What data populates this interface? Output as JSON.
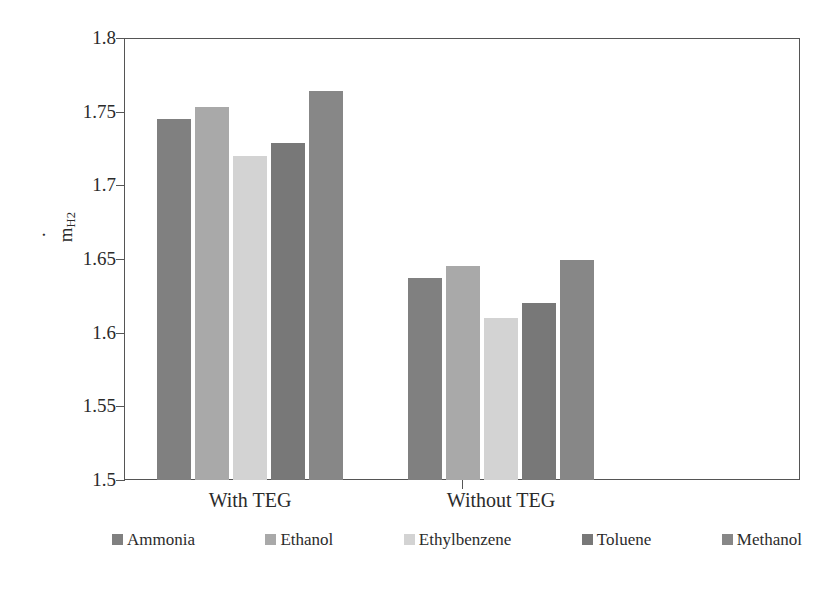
{
  "chart_data": {
    "type": "bar",
    "title": "",
    "subtitle": "",
    "xlabel": "",
    "ylabel": "mdot_H2",
    "ylabel_display": "ṁ",
    "ylabel_subscript": "H2",
    "categories": [
      "With TEG",
      "Without TEG"
    ],
    "series": [
      {
        "name": "Ammonia",
        "color": "#808080",
        "values": [
          1.745,
          1.637
        ]
      },
      {
        "name": "Ethanol",
        "color": "#a9a9a9",
        "values": [
          1.753,
          1.645
        ]
      },
      {
        "name": "Ethylbenzene",
        "color": "#d3d3d3",
        "values": [
          1.72,
          1.61
        ]
      },
      {
        "name": "Toluene",
        "color": "#787878",
        "values": [
          1.729,
          1.62
        ]
      },
      {
        "name": "Methanol",
        "color": "#878787",
        "values": [
          1.764,
          1.649
        ]
      }
    ],
    "ylim": [
      1.5,
      1.8
    ],
    "ytick_values": [
      1.5,
      1.55,
      1.6,
      1.65,
      1.7,
      1.75,
      1.8
    ],
    "ytick_labels": [
      "1.5",
      "1.55",
      "1.6",
      "1.65",
      "1.7",
      "1.75",
      "1.8"
    ],
    "grid": false,
    "legend_position": "bottom",
    "frame": true,
    "axis_color": "#555555"
  },
  "axis": {
    "y_label_main": "ṁ",
    "y_label_sub": "H2"
  },
  "legend": {
    "items": [
      {
        "label": "Ammonia",
        "color": "#808080"
      },
      {
        "label": "Ethanol",
        "color": "#a9a9a9"
      },
      {
        "label": "Ethylbenzene",
        "color": "#d3d3d3"
      },
      {
        "label": "Toluene",
        "color": "#787878"
      },
      {
        "label": "Methanol",
        "color": "#878787"
      }
    ]
  }
}
